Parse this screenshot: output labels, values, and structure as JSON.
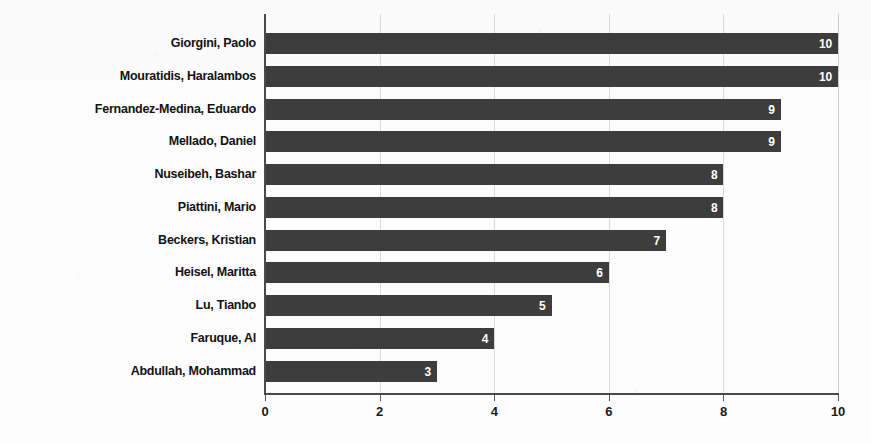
{
  "chart_data": {
    "type": "bar",
    "orientation": "horizontal",
    "title": "",
    "subtitle": "",
    "xlabel": "",
    "ylabel": "",
    "xlim": [
      0,
      10
    ],
    "xticks": [
      "0",
      "2",
      "4",
      "6",
      "8",
      "10"
    ],
    "xtick_values": [
      0,
      2,
      4,
      6,
      8,
      10
    ],
    "grid": true,
    "grid_axis": "x",
    "legend": false,
    "legend_position": "none",
    "bar_color": "#3d3d3d",
    "value_label_color": "#ffffff",
    "axis_color": "#4a4a4a",
    "gridline_color": "#d9d9d9",
    "background_color": "#fdfdfd",
    "categories": [
      "Giorgini, Paolo",
      "Mouratidis, Haralambos",
      "Fernandez-Medina, Eduardo",
      "Mellado, Daniel",
      "Nuseibeh, Bashar",
      "Piattini, Mario",
      "Beckers, Kristian",
      "Heisel, Maritta",
      "Lu, Tianbo",
      "Faruque, Al",
      "Abdullah, Mohammad"
    ],
    "values": [
      10,
      10,
      9,
      9,
      8,
      8,
      7,
      6,
      5,
      4,
      3
    ],
    "value_labels": [
      "10",
      "10",
      "9",
      "9",
      "8",
      "8",
      "7",
      "6",
      "5",
      "4",
      "3"
    ]
  }
}
